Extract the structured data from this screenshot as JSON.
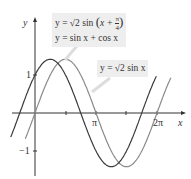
{
  "chart_data": {
    "type": "line",
    "title": "",
    "xlabel": "x",
    "ylabel": "y",
    "xlim": [
      -0.9,
      7.0
    ],
    "ylim": [
      -1.5,
      1.6
    ],
    "x_ticks": [
      {
        "value": 1.5708,
        "label": ""
      },
      {
        "value": 3.1416,
        "label": "π"
      },
      {
        "value": 4.7124,
        "label": ""
      },
      {
        "value": 6.2832,
        "label": "2π"
      }
    ],
    "y_ticks": [
      {
        "value": 1,
        "label": "1"
      },
      {
        "value": -1,
        "label": "−1"
      }
    ],
    "series": [
      {
        "name": "y = √2 sin(x + π/4) = sin x + cos x",
        "formula": "sqrt(2)*sin(x+pi/4)",
        "color": "#3a3a3a"
      },
      {
        "name": "y = √2 sin x",
        "formula": "sqrt(2)*sin(x)",
        "color": "#7a7a7a"
      }
    ],
    "annotations": [
      {
        "text": "y = √2 sin(x + π/4)",
        "line2": "y = sin x + cos x"
      },
      {
        "text": "y = √2 sin x"
      }
    ],
    "grid": false,
    "legend": "callout boxes"
  },
  "labels": {
    "y_axis": "y",
    "x_axis": "x",
    "one": "1",
    "minus_one": "−1",
    "pi": "π",
    "two_pi": "2π",
    "box1_line1_a": "y = √2 sin",
    "box1_line1_b": "x + ",
    "box1_frac_num": "π",
    "box1_frac_den": "4",
    "box1_line2": "y = sin x + cos x",
    "box2": "y = √2 sin x"
  }
}
